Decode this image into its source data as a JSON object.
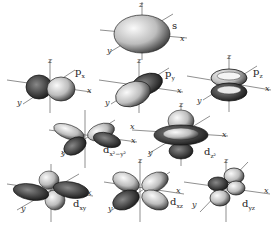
{
  "figure": {
    "axes": {
      "x": "x",
      "y": "y",
      "z": "z"
    },
    "orbitals": [
      {
        "id": "s",
        "label": "s",
        "sub": ""
      },
      {
        "id": "px",
        "label": "p",
        "sub": "x"
      },
      {
        "id": "py",
        "label": "p",
        "sub": "y"
      },
      {
        "id": "pz",
        "label": "p",
        "sub": "z"
      },
      {
        "id": "dx2y2",
        "label": "d",
        "sub": "x²−y²"
      },
      {
        "id": "dz2",
        "label": "d",
        "sub": "z²"
      },
      {
        "id": "dxy",
        "label": "d",
        "sub": "xy"
      },
      {
        "id": "dxz",
        "label": "d",
        "sub": "xz"
      },
      {
        "id": "dyz",
        "label": "d",
        "sub": "yz"
      }
    ]
  },
  "colors": {
    "ink": "#222222",
    "shade": "#555555",
    "light": "#eeeeee",
    "background": "#ffffff"
  }
}
